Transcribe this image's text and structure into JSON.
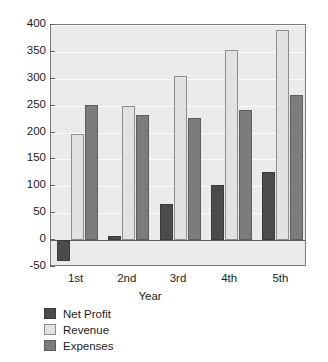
{
  "chart_data": {
    "type": "bar",
    "title": "",
    "xlabel": "Year",
    "ylabel": "",
    "categories": [
      "1st",
      "2nd",
      "3rd",
      "4th",
      "5th"
    ],
    "series": [
      {
        "name": "Net Profit",
        "color": "#4b4b4b",
        "values": [
          -38,
          7,
          68,
          103,
          126
        ]
      },
      {
        "name": "Revenue",
        "color": "#e2e2e2",
        "values": [
          197,
          249,
          306,
          353,
          390
        ]
      },
      {
        "name": "Expenses",
        "color": "#7c7c7c",
        "values": [
          251,
          232,
          227,
          242,
          270
        ]
      }
    ],
    "ylim": [
      -50,
      400
    ],
    "yticks": [
      "-50",
      "0",
      "50",
      "100",
      "150",
      "200",
      "250",
      "300",
      "350",
      "400"
    ],
    "ytick_values": [
      -50,
      0,
      50,
      100,
      150,
      200,
      250,
      300,
      350,
      400
    ],
    "grid": true,
    "grid_axis": "y",
    "legend_position": "below-left",
    "plot_background": "#ebebeb",
    "figure_background": "#ffffff",
    "zero_line": 0
  },
  "legend": {
    "entries": [
      {
        "label": "Net Profit"
      },
      {
        "label": "Revenue"
      },
      {
        "label": "Expenses"
      }
    ]
  },
  "axes": {
    "x_title": "Year"
  }
}
